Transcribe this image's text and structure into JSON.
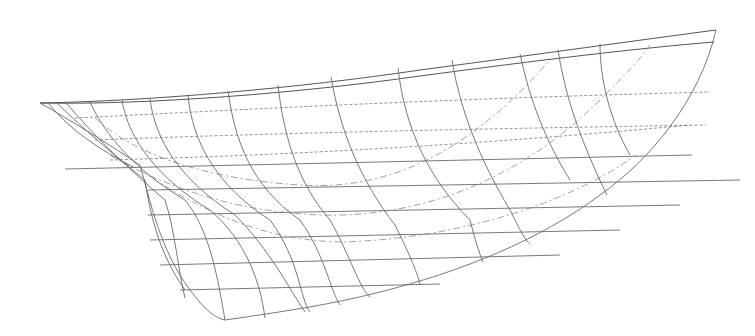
{
  "drawing": {
    "type": "hull lines plan (perspective/profile view)",
    "colors": {
      "background": "#ffffff",
      "line": "#6a6a6a",
      "dashed": "#777777"
    },
    "sheer_lines": [
      "M40,103 C150,101 300,88 420,70 C540,54 640,40 716,30",
      "M40,103 C150,105 300,93 420,76 C540,60 640,48 714,42"
    ],
    "waterline": "M65,169 L692,155",
    "outline": "M40,103 C70,120 110,145 140,165 C150,200 160,250 190,290 C205,310 215,318 225,320 C280,312 330,305 380,292 C460,272 540,240 600,195 C650,160 700,100 716,30",
    "horizontal_lines": [
      "M148,190 L740,180",
      "M148,215 L680,205",
      "M150,240 L620,230",
      "M160,265 L560,255",
      "M180,290 L440,284"
    ],
    "dashed_waterlines": [
      "M75,118 C200,112 400,100 710,92",
      "M95,140 C220,135 400,130 706,125",
      "M110,160 C240,156 420,150 690,125"
    ],
    "dashdot_diagonals": [
      "M95,118 C140,160 220,180 300,185 C400,192 480,140 550,60",
      "M110,155 C170,190 240,212 320,215 C420,218 520,180 600,100 C620,80 640,60 650,45",
      "M140,170 C200,210 260,240 340,242 C440,240 560,210 636,155"
    ],
    "stations": [
      "M48,103 C70,130 100,150 135,168",
      "M58,104 C90,135 120,160 145,180 C150,215 160,255 185,290",
      "M66,103 C98,140 130,170 165,200 C175,230 178,270 185,298",
      "M90,102 C105,135 135,170 185,200 C210,230 218,280 225,320",
      "M122,100 C128,140 160,180 210,210 C245,240 260,280 265,318",
      "M150,99 C155,140 180,180 235,215 C270,250 290,290 305,312",
      "M188,95 C192,140 215,185 270,220 C300,260 300,300 310,312",
      "M228,91 C235,140 250,185 300,220 C325,255 330,290 340,305",
      "M278,85 C283,130 295,180 330,220 C350,255 360,290 370,297",
      "M331,77 C340,130 360,180 395,225 C410,255 418,275 420,284",
      "M398,68 C405,130 430,180 470,220 C475,240 480,255 483,262",
      "M452,60 C460,110 480,160 510,210 C520,230 525,240 530,244",
      "M520,54 C530,100 545,140 570,180",
      "M558,50 C565,95 580,140 607,195",
      "M600,44 C600,80 610,120 630,155"
    ]
  }
}
